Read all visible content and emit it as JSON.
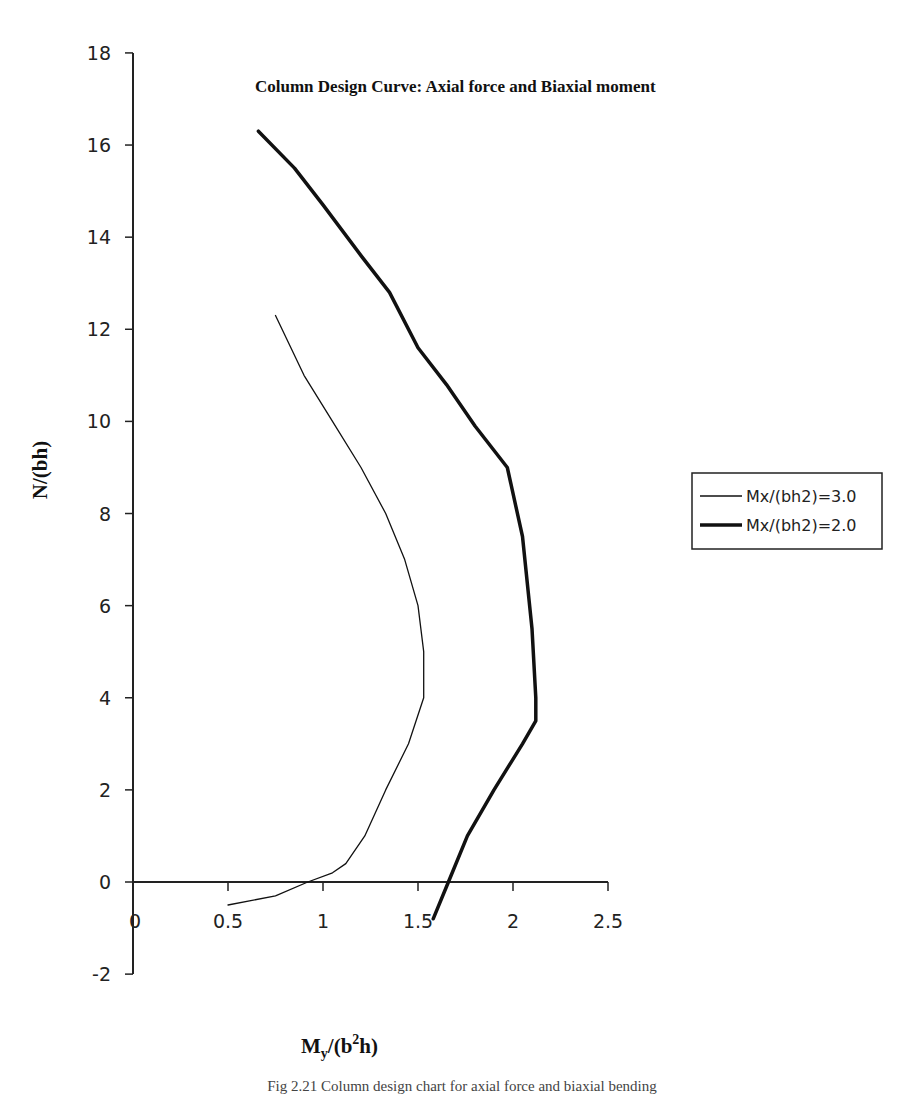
{
  "chart_data": {
    "type": "line",
    "title": "Column Design Curve: Axial force and Biaxial moment",
    "xlabel": "My/(b2h)",
    "xlabel_parts": {
      "main": "M",
      "sub": "y",
      "mid": "/(b",
      "sup": "2",
      "end": "h)"
    },
    "ylabel": "N/(bh)",
    "xlim": [
      0,
      2.5
    ],
    "ylim": [
      -2,
      18
    ],
    "x_ticks": [
      "0",
      "0.5",
      "1",
      "1.5",
      "2",
      "2.5"
    ],
    "y_ticks": [
      "-2",
      "0",
      "2",
      "4",
      "6",
      "8",
      "10",
      "12",
      "14",
      "16",
      "18"
    ],
    "grid": false,
    "legend_position": "right",
    "series": [
      {
        "name": "Mx/(bh2)=3.0",
        "line_width": "thin",
        "points": [
          [
            0.75,
            12.3
          ],
          [
            0.9,
            11.0
          ],
          [
            1.05,
            10.0
          ],
          [
            1.2,
            9.0
          ],
          [
            1.33,
            8.0
          ],
          [
            1.43,
            7.0
          ],
          [
            1.5,
            6.0
          ],
          [
            1.53,
            5.0
          ],
          [
            1.53,
            4.0
          ],
          [
            1.45,
            3.0
          ],
          [
            1.33,
            2.0
          ],
          [
            1.22,
            1.0
          ],
          [
            1.12,
            0.4
          ],
          [
            1.05,
            0.2
          ],
          [
            0.92,
            0.0
          ],
          [
            0.75,
            -0.3
          ],
          [
            0.5,
            -0.5
          ]
        ]
      },
      {
        "name": "Mx/(bh2)=2.0",
        "line_width": "thick",
        "points": [
          [
            0.66,
            16.3
          ],
          [
            0.85,
            15.5
          ],
          [
            1.0,
            14.7
          ],
          [
            1.2,
            13.6
          ],
          [
            1.35,
            12.8
          ],
          [
            1.5,
            11.6
          ],
          [
            1.65,
            10.8
          ],
          [
            1.8,
            9.9
          ],
          [
            1.97,
            9.0
          ],
          [
            2.05,
            7.5
          ],
          [
            2.1,
            5.5
          ],
          [
            2.12,
            4.0
          ],
          [
            2.12,
            3.5
          ],
          [
            2.05,
            3.0
          ],
          [
            1.9,
            2.0
          ],
          [
            1.76,
            1.0
          ],
          [
            1.66,
            0.0
          ],
          [
            1.58,
            -0.8
          ]
        ]
      }
    ]
  },
  "caption": "Fig 2.21 Column design chart for axial force and biaxial bending"
}
